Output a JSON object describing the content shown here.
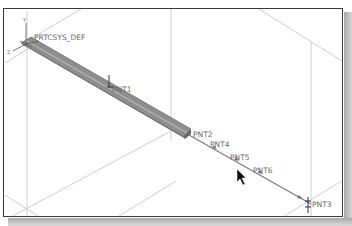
{
  "viewport": {
    "type": "3d-model-view",
    "background_color": "#ffffff",
    "border_color": "#3a3a3a",
    "construction_line_color": "#bdbdbd",
    "beam_color": "#8c8c8c"
  },
  "csys": {
    "label": "PRTCSYS_DEF",
    "axis_labels": {
      "x": "X",
      "y": "Y",
      "z": "Z"
    }
  },
  "datum_points": [
    {
      "id": "pnt1",
      "label": "PNT1"
    },
    {
      "id": "pnt2",
      "label": "PNT2"
    },
    {
      "id": "pnt4",
      "label": "PNT4"
    },
    {
      "id": "pnt5",
      "label": "PNT5"
    },
    {
      "id": "pnt6",
      "label": "PNT6"
    },
    {
      "id": "pnt3",
      "label": "PNT3"
    }
  ],
  "cursor": {
    "icon": "arrow-pointer-icon"
  }
}
